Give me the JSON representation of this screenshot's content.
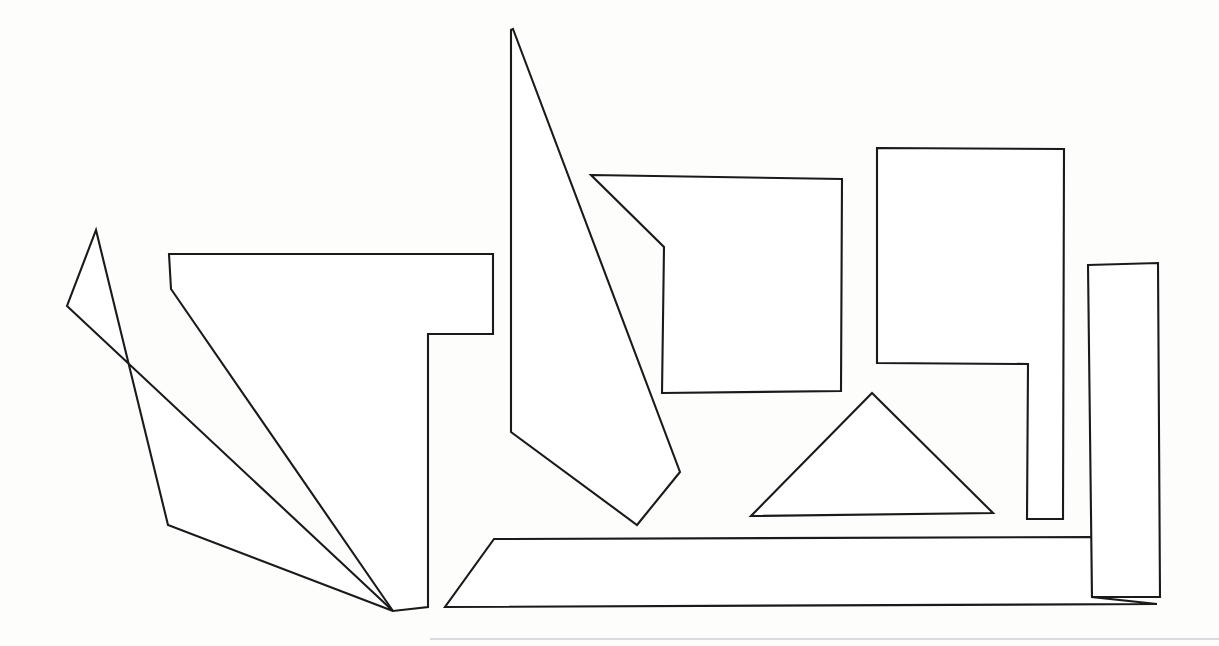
{
  "figure": {
    "canvas": {
      "width": 1219,
      "height": 646
    },
    "style": {
      "background_color": "#fdfdfd",
      "stroke_color": "#1a1a1a",
      "fill_color": "#ffffff",
      "stroke_width": 2.1,
      "page_edge_color": "#b9b9bd"
    },
    "shape_count": 8
  },
  "shapes": [
    {
      "id": "shape-left-sliver",
      "name": "left-elongated-quadrilateral",
      "sides": 5,
      "label": "Long thin left blade",
      "points": "96,230 168,525 393,611 67,306"
    },
    {
      "id": "shape-left-big",
      "name": "left-stepped-polygon",
      "sides": 8,
      "label": "Large stepped polygon, left centre",
      "points": "169,254 493,254 493,334 428,334 428,607 393,611 171,289"
    },
    {
      "id": "shape-tall-wedge",
      "name": "tall-wedge-polygon",
      "sides": 5,
      "label": "Tall narrow wedge rising to top of page",
      "points": "513,29 680,472 637,525 511,432 511,30"
    },
    {
      "id": "shape-notched-square",
      "name": "notched-square-polygon",
      "sides": 6,
      "label": "Square with notched left edge",
      "points": "591,175 842,179 841,391 662,393 664,247"
    },
    {
      "id": "shape-right-L",
      "name": "right-stepped-L-polygon",
      "sides": 6,
      "label": "Large L shaped polygon on the right",
      "points": "877,148 1064,149 1063,519 1027,519 1028,364 877,363"
    },
    {
      "id": "shape-triangle",
      "name": "triangle-polygon",
      "sides": 3,
      "label": "Isosceles triangle, lower centre right",
      "points": "872,393 993,513 751,516"
    },
    {
      "id": "shape-right-tall-rect",
      "name": "right-tall-rectangle",
      "sides": 4,
      "label": "Tall narrow rectangle on far right",
      "points": "1088,265 1158,263 1160,597 1092,597"
    },
    {
      "id": "shape-bottom-band",
      "name": "bottom-band-polygon",
      "sides": 6,
      "label": "Wide flat band across the bottom",
      "points": "494,539 1092,537 1092,597 1157,604 445,607"
    }
  ],
  "page_edge": {
    "name": "page-bottom-edge",
    "label": "Faint scanned page bottom edge",
    "y": 639,
    "x_start": 430,
    "x_end": 1219
  }
}
